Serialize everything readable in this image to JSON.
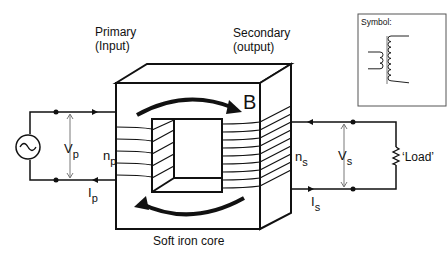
{
  "labels": {
    "primary_line1": "Primary",
    "primary_line2": "(Input)",
    "secondary_line1": "Secondary",
    "secondary_line2": "(output)",
    "flux": "B",
    "core": "Soft iron core",
    "load": "‘Load’",
    "symbol_title": "Symbol:",
    "vp_main": "V",
    "vp_sub": "p",
    "np_main": "n",
    "np_sub": "p",
    "ip_main": "I",
    "ip_sub": "p",
    "vs_main": "V",
    "vs_sub": "s",
    "ns_main": "n",
    "ns_sub": "s",
    "is_main": "I",
    "is_sub": "s"
  },
  "icons": {
    "ac_source": "sine-wave-source-icon",
    "load": "resistor-zigzag-icon",
    "transformer_symbol": "transformer-coils-icon"
  },
  "colors": {
    "ink": "#111111",
    "background": "#ffffff",
    "symbol_border": "#555555",
    "core_line": "#d8d8d8"
  }
}
